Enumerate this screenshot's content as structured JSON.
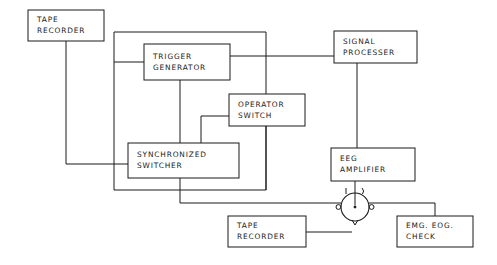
{
  "diagram": {
    "background_color": "#ffffff",
    "line_color": "#1a1a1a",
    "nodes": [
      {
        "id": "tape-recorder-top",
        "name": "tape-recorder-top",
        "lines": [
          "TAPE",
          "RECORDER"
        ],
        "x": 28,
        "y": 10,
        "w": 76,
        "h": 31
      },
      {
        "id": "trigger-generator",
        "name": "trigger-generator",
        "lines": [
          "TRIGGER",
          "GENERATOR"
        ],
        "x": 144,
        "y": 44,
        "w": 86,
        "h": 36
      },
      {
        "id": "signal-processer",
        "name": "signal-processer",
        "lines": [
          "SIGNAL",
          "PROCESSER"
        ],
        "x": 334,
        "y": 31,
        "w": 83,
        "h": 32
      },
      {
        "id": "operator-switch",
        "name": "operator-switch",
        "lines": [
          "OPERATOR",
          "SWITCH"
        ],
        "x": 229,
        "y": 94,
        "w": 76,
        "h": 32
      },
      {
        "id": "synchronized-switcher",
        "name": "synchronized-switcher",
        "lines": [
          "SYNCHRONIZED",
          "SWITCHER"
        ],
        "x": 128,
        "y": 143,
        "w": 111,
        "h": 35
      },
      {
        "id": "eeg-amplifier",
        "name": "eeg-amplifier",
        "lines": [
          "EEG",
          "AMPLIFIER"
        ],
        "x": 331,
        "y": 148,
        "w": 84,
        "h": 33
      },
      {
        "id": "tape-recorder-bottom",
        "name": "tape-recorder-bottom",
        "lines": [
          "TAPE",
          "RECORDER"
        ],
        "x": 228,
        "y": 216,
        "w": 78,
        "h": 31
      },
      {
        "id": "emg-eog-check",
        "name": "emg-eog-check",
        "lines": [
          "EMG. EOG.",
          "CHECK"
        ],
        "x": 397,
        "y": 216,
        "w": 76,
        "h": 31
      }
    ],
    "rotary_switch": {
      "name": "rotary-switch",
      "cx": 355,
      "cy": 207,
      "r": 14
    },
    "wires": [
      {
        "name": "wire-tape-top-to-synchronized-switcher",
        "path": "M 66,41 L 66,164 L 128,164"
      },
      {
        "name": "wire-top-bus-to-trigger-generator",
        "path": "M 114,62 L 144,62"
      },
      {
        "name": "wire-top-bus-vertical-left",
        "path": "M 114,32 L 114,62"
      },
      {
        "name": "wire-top-bus-horizontal",
        "path": "M 114,32 L 266,32"
      },
      {
        "name": "wire-top-bus-right-down-to-bottom-rail",
        "path": "M 266,32 L 266,190 L 180,190"
      },
      {
        "name": "wire-left-rail-vertical",
        "path": "M 114,62 L 114,190"
      },
      {
        "name": "wire-left-rail-to-bottom",
        "path": "M 114,190 L 180,190"
      },
      {
        "name": "wire-trigger-generator-to-signal-processer",
        "path": "M 230,56 L 334,56"
      },
      {
        "name": "wire-trigger-generator-to-synchronized-switcher",
        "path": "M 180,80 L 180,143"
      },
      {
        "name": "wire-operator-switch-left-feed",
        "path": "M 201,116 L 229,116"
      },
      {
        "name": "wire-operator-switch-left-riser",
        "path": "M 201,116 L 201,143"
      },
      {
        "name": "wire-operator-switch-down-to-rail",
        "path": "M 266,126 L 266,190"
      },
      {
        "name": "wire-signal-processer-to-eeg-amplifier",
        "path": "M 357,63 L 357,148"
      },
      {
        "name": "wire-synchronized-switcher-to-rotary-bus",
        "path": "M 180,178 L 180,203 L 341,203"
      },
      {
        "name": "wire-eeg-amplifier-to-rotary",
        "path": "M 355,181 L 355,207"
      },
      {
        "name": "wire-rotary-to-emg-eog-check",
        "path": "M 369,203 L 435,203 L 435,216"
      },
      {
        "name": "wire-tape-recorder-bottom-to-rotary",
        "path": "M 306,232 L 352,232"
      }
    ]
  }
}
